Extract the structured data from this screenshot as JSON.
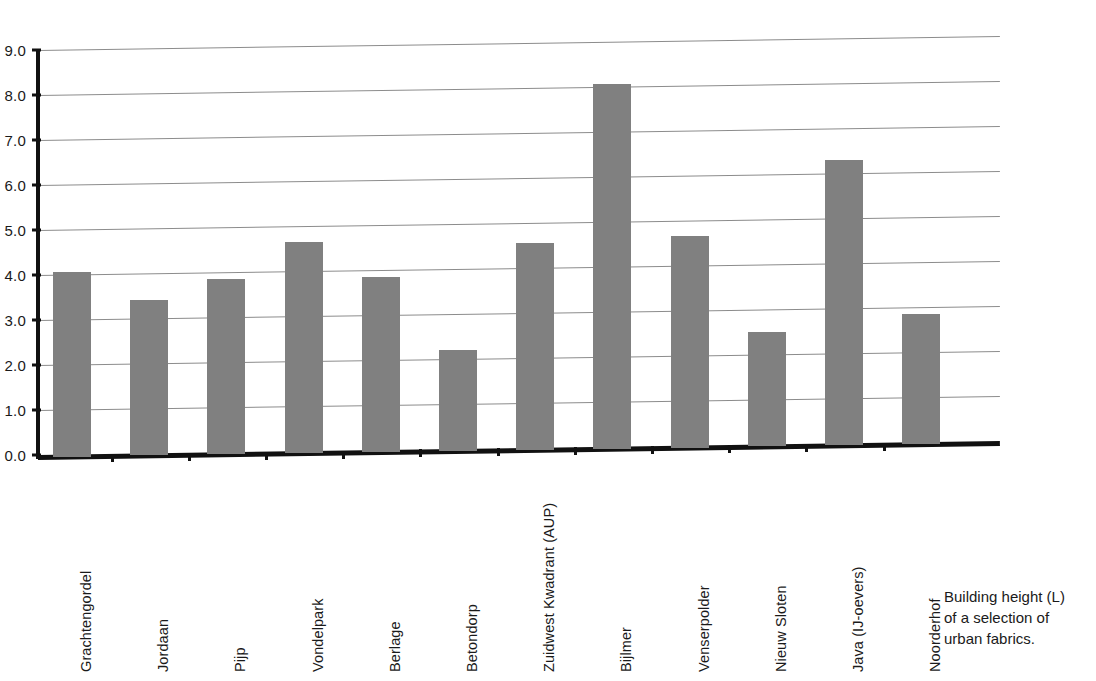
{
  "chart_data": {
    "type": "bar",
    "title": "",
    "xlabel": "",
    "ylabel": "",
    "ylim": [
      0.0,
      9.0
    ],
    "grid": true,
    "legend": "none",
    "bar_color": "#808080",
    "axis_color": "#111111",
    "gridline_color": "#8c8c8c",
    "ytick_labels": [
      "9.0",
      "8.0",
      "7.0",
      "6.0",
      "5.0",
      "4.0",
      "3.0",
      "2.0",
      "1.0",
      "0.0"
    ],
    "ytick_values": [
      9.0,
      8.0,
      7.0,
      6.0,
      5.0,
      4.0,
      3.0,
      2.0,
      1.0,
      0.0
    ],
    "categories": [
      "Grachtengordel",
      "Jordaan",
      "Pijp",
      "Vondelpark",
      "Berlage",
      "Betondorp",
      "Zuidwest Kwadrant (AUP)",
      "Bijlmer",
      "Venserpolder",
      "Nieuw Sloten",
      "Java (IJ-oevers)",
      "Noorderhof"
    ],
    "values": [
      4.05,
      3.4,
      3.85,
      4.65,
      3.85,
      2.2,
      4.55,
      8.05,
      4.65,
      2.5,
      6.3,
      2.85
    ]
  },
  "caption": {
    "line1": "Building height (L)",
    "line2": "of a selection of",
    "line3": "urban fabrics."
  }
}
